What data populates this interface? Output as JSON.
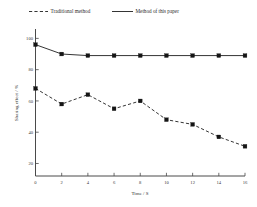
{
  "chart_data": {
    "type": "line",
    "title": "",
    "xlabel": "Time / S",
    "ylabel": "Sharing effect / %",
    "xlim": [
      0,
      16
    ],
    "ylim": [
      12,
      106
    ],
    "xticks": [
      0,
      2,
      4,
      6,
      8,
      10,
      12,
      14,
      16
    ],
    "xtick_labels": [
      "0",
      "2",
      "4",
      "6",
      "8",
      "10",
      "12",
      "14",
      "16"
    ],
    "yticks": [
      20,
      40,
      60,
      80,
      100
    ],
    "ytick_labels": [
      "20",
      "40",
      "60",
      "80",
      "100"
    ],
    "grid": false,
    "legend_position": "top",
    "x": [
      0,
      2,
      4,
      6,
      8,
      10,
      12,
      14,
      16
    ],
    "series": [
      {
        "name": "Traditional method",
        "style": "dashed",
        "marker": "square",
        "color": "#1e1e1e",
        "values": [
          68,
          58,
          64,
          55,
          60,
          48,
          45,
          37,
          31
        ]
      },
      {
        "name": "Method of this paper",
        "style": "solid",
        "marker": "square",
        "color": "#1e1e1e",
        "values": [
          96,
          90,
          89,
          89,
          89,
          89,
          89,
          89,
          89
        ]
      }
    ]
  },
  "legend": {
    "entries": [
      {
        "label": "Traditional method",
        "style": "dashed"
      },
      {
        "label": "Method of this paper",
        "style": "solid"
      }
    ]
  }
}
